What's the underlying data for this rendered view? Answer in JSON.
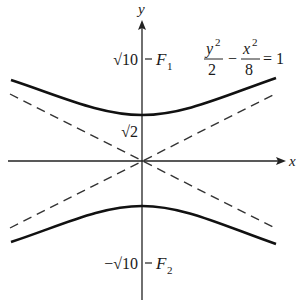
{
  "diagram": {
    "type": "hyperbola",
    "equation": {
      "term1_num": "y",
      "term1_exp": "2",
      "term1_den": "2",
      "minus": "−",
      "term2_num": "x",
      "term2_exp": "2",
      "term2_den": "8",
      "equals": "= 1"
    },
    "axes": {
      "x_label": "x",
      "y_label": "y"
    },
    "labels": {
      "f1": "F",
      "f1_sub": "1",
      "f1_value": "√10",
      "f2": "F",
      "f2_sub": "2",
      "f2_value": "−√10",
      "vertex_value": "√2"
    },
    "colors": {
      "curve": "#111111",
      "asymptote": "#333333",
      "axis": "#222222"
    }
  }
}
